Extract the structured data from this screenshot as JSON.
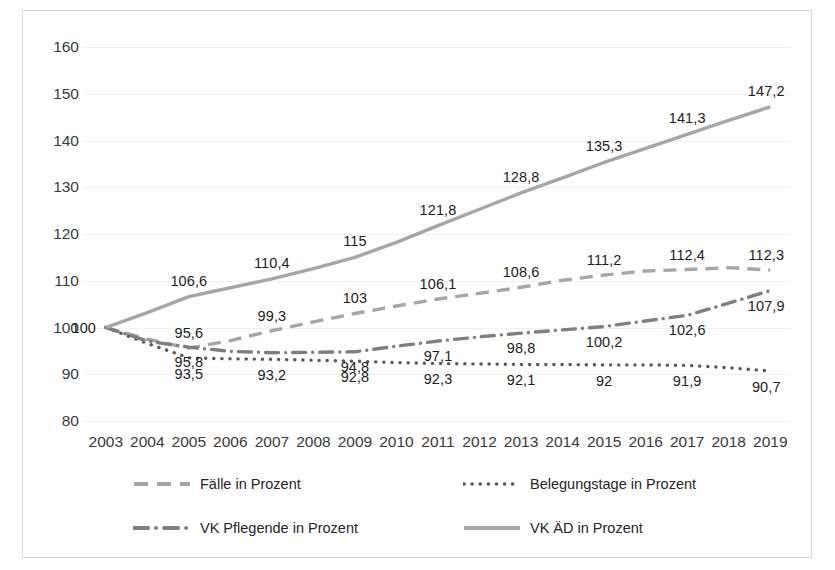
{
  "chart_data": {
    "type": "line",
    "title": "",
    "xlabel": "",
    "ylabel": "",
    "xlim": [
      2003,
      2019
    ],
    "ylim": [
      80,
      160
    ],
    "yticks": [
      160,
      150,
      140,
      130,
      120,
      110,
      100,
      90,
      80
    ],
    "grid": true,
    "legend_position": "bottom",
    "categories": [
      2003,
      2004,
      2005,
      2006,
      2007,
      2008,
      2009,
      2010,
      2011,
      2012,
      2013,
      2014,
      2015,
      2016,
      2017,
      2018,
      2019
    ],
    "series": [
      {
        "name": "Fälle in Prozent",
        "style": "dashed",
        "color": "#a6a6a6",
        "values": [
          100,
          97.5,
          95.6,
          97.2,
          99.3,
          101.2,
          103,
          104.6,
          106.1,
          107.3,
          108.6,
          110.1,
          111.2,
          112.1,
          112.4,
          112.8,
          112.3
        ],
        "labels": {
          "2003": "100",
          "2005": "95,6",
          "2007": "99,3",
          "2009": "103",
          "2011": "106,1",
          "2013": "108,6",
          "2015": "111,2",
          "2017": "112,4",
          "2019": "112,3"
        }
      },
      {
        "name": "Belegungstage in Prozent",
        "style": "dotted",
        "color": "#595959",
        "values": [
          100,
          96.6,
          93.5,
          93.3,
          93.2,
          93.0,
          92.8,
          92.5,
          92.3,
          92.2,
          92.1,
          92.1,
          92.0,
          92.0,
          91.9,
          91.4,
          90.7
        ],
        "labels": {
          "2005": "93,5",
          "2007": "93,2",
          "2009": "92,8",
          "2011": "92,3",
          "2013": "92,1",
          "2015": "92",
          "2017": "91,9",
          "2019": "90,7"
        }
      },
      {
        "name": "VK Pflegende in Prozent",
        "style": "dashdot",
        "color": "#7f7f7f",
        "values": [
          100,
          97.1,
          95.8,
          94.9,
          94.6,
          94.7,
          94.8,
          96.0,
          97.1,
          98.0,
          98.8,
          99.5,
          100.2,
          101.4,
          102.6,
          105.2,
          107.9
        ],
        "labels": {
          "2005": "95,8",
          "2009": "94,8",
          "2011": "97,1",
          "2013": "98,8",
          "2015": "100,2",
          "2017": "102,6",
          "2019": "107,9"
        }
      },
      {
        "name": "VK ÄD in Prozent",
        "style": "solid",
        "color": "#a6a6a6",
        "values": [
          100,
          103.2,
          106.6,
          108.5,
          110.4,
          112.6,
          115,
          118.2,
          121.8,
          125.3,
          128.8,
          132.0,
          135.3,
          138.3,
          141.3,
          144.3,
          147.2
        ],
        "labels": {
          "2005": "106,6",
          "2007": "110,4",
          "2009": "115",
          "2011": "121,8",
          "2013": "128,8",
          "2015": "135,3",
          "2017": "141,3",
          "2019": "147,2"
        }
      }
    ]
  },
  "legend": {
    "items": [
      {
        "label": "Fälle in Prozent",
        "marker": "dashed-line-marker"
      },
      {
        "label": "Belegungstage in Prozent",
        "marker": "dotted-line-marker"
      },
      {
        "label": "VK Pflegende in Prozent",
        "marker": "dashdot-line-marker"
      },
      {
        "label": "VK ÄD in Prozent",
        "marker": "solid-line-marker"
      }
    ]
  }
}
